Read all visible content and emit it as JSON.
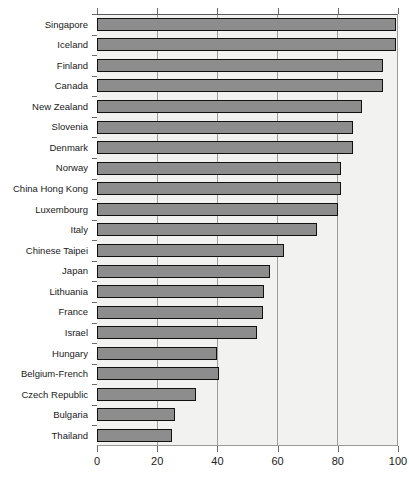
{
  "chart_data": {
    "type": "bar",
    "orientation": "horizontal",
    "title": "",
    "xlabel": "",
    "ylabel": "",
    "xlim": [
      0,
      100
    ],
    "xticks": [
      0,
      20,
      40,
      60,
      80,
      100
    ],
    "grid": true,
    "legend": false,
    "bar_color": "#8d8d8d",
    "bar_edge_color": "#111111",
    "plot_background": "#f2f2f0",
    "categories": [
      "Singapore",
      "Iceland",
      "Finland",
      "Canada",
      "New Zealand",
      "Slovenia",
      "Denmark",
      "Norway",
      "China Hong Kong",
      "Luxembourg",
      "Italy",
      "Chinese Taipei",
      "Japan",
      "Lithuania",
      "France",
      "Israel",
      "Hungary",
      "Belgium-French",
      "Czech Republic",
      "Bulgaria",
      "Thailand"
    ],
    "values": [
      99.5,
      99.5,
      95.0,
      95.0,
      88.0,
      85.0,
      85.0,
      81.0,
      81.0,
      80.0,
      73.0,
      62.0,
      57.5,
      55.5,
      55.0,
      53.0,
      40.0,
      40.5,
      33.0,
      26.0,
      25.0
    ]
  }
}
